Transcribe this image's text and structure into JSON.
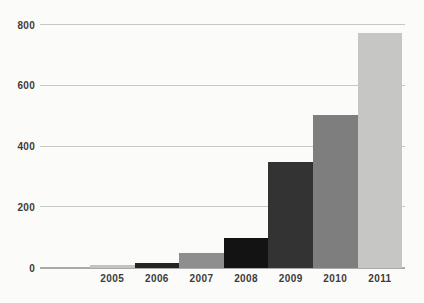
{
  "chart_data": {
    "type": "bar",
    "categories": [
      "2005",
      "2006",
      "2007",
      "2008",
      "2009",
      "2010",
      "2011"
    ],
    "values": [
      10,
      15,
      50,
      100,
      350,
      505,
      775
    ],
    "bar_colors": [
      "#c3c3c2",
      "#242424",
      "#8e8e8e",
      "#131313",
      "#333333",
      "#7e7e7e",
      "#c6c6c5"
    ],
    "title": "",
    "xlabel": "",
    "ylabel": "",
    "ylim": [
      0,
      800
    ],
    "yticks": [
      0,
      200,
      400,
      600,
      800
    ],
    "grid": "horizontal-only",
    "legend": "none",
    "colors": {
      "background": "#fbfbf9",
      "gridline": "#c7c7c5",
      "baseline": "#a9a9a7",
      "tick_label": "#3b3b3b"
    }
  }
}
